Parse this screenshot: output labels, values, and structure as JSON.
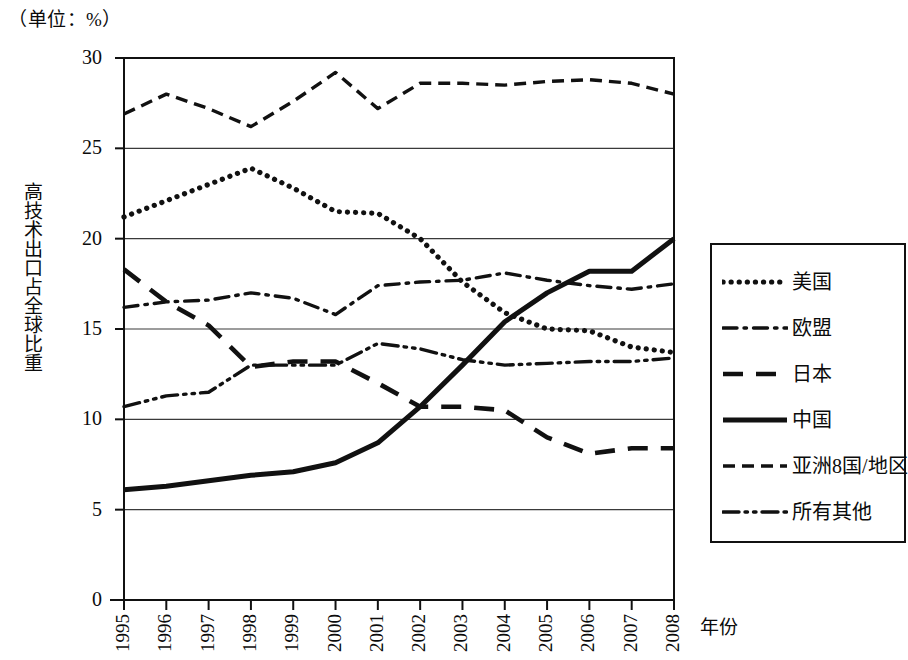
{
  "unit_note": "（单位：%）",
  "axis": {
    "y_title": "高技术出口占全球比重",
    "x_title": "年份",
    "y_ticks": [
      "0",
      "5",
      "10",
      "15",
      "20",
      "25",
      "30"
    ],
    "x_ticks": [
      "1995",
      "1996",
      "1997",
      "1998",
      "1999",
      "2000",
      "2001",
      "2002",
      "2003",
      "2004",
      "2005",
      "2006",
      "2007",
      "2008"
    ]
  },
  "legend": {
    "items": [
      {
        "label": "美国",
        "style": "dotted",
        "color": "#111111"
      },
      {
        "label": "欧盟",
        "style": "dash-dot",
        "color": "#111111"
      },
      {
        "label": "日本",
        "style": "dashed-long",
        "color": "#111111"
      },
      {
        "label": "中国",
        "style": "solid",
        "color": "#111111"
      },
      {
        "label": "亚洲8国/地区",
        "style": "dashed-short",
        "color": "#111111"
      },
      {
        "label": "所有其他",
        "style": "dash-dot-dot",
        "color": "#111111"
      }
    ]
  },
  "chart_data": {
    "type": "line",
    "title": "",
    "subtitle": "",
    "unit": "%",
    "xlabel": "年份",
    "ylabel": "高技术出口占全球比重",
    "xlim": [
      1995,
      2008
    ],
    "ylim": [
      0,
      30
    ],
    "ytick_step": 5,
    "grid": true,
    "grid_axis": "y",
    "legend_position": "right",
    "x": [
      1995,
      1996,
      1997,
      1998,
      1999,
      2000,
      2001,
      2002,
      2003,
      2004,
      2005,
      2006,
      2007,
      2008
    ],
    "series": [
      {
        "name": "美国",
        "style": "dotted",
        "values": [
          21.2,
          22.1,
          23.0,
          23.9,
          22.8,
          21.5,
          21.4,
          20.0,
          17.6,
          15.9,
          15.0,
          14.9,
          14.0,
          13.7
        ]
      },
      {
        "name": "欧盟",
        "style": "dash-dot",
        "values": [
          16.2,
          16.5,
          16.6,
          17.0,
          16.7,
          15.8,
          17.4,
          17.6,
          17.7,
          18.1,
          17.7,
          17.4,
          17.2,
          17.5
        ]
      },
      {
        "name": "日本",
        "style": "dashed-long",
        "values": [
          18.3,
          16.5,
          15.2,
          12.9,
          13.2,
          13.2,
          12.0,
          10.7,
          10.7,
          10.5,
          9.0,
          8.1,
          8.4,
          8.4
        ]
      },
      {
        "name": "中国",
        "style": "solid",
        "values": [
          6.1,
          6.3,
          6.6,
          6.9,
          7.1,
          7.6,
          8.7,
          10.7,
          13.0,
          15.4,
          17.0,
          18.2,
          18.2,
          20.0
        ]
      },
      {
        "name": "亚洲8国/地区",
        "style": "dashed-short",
        "values": [
          26.9,
          28.0,
          27.2,
          26.2,
          27.6,
          29.2,
          27.2,
          28.6,
          28.6,
          28.5,
          28.7,
          28.8,
          28.6,
          28.0
        ]
      },
      {
        "name": "所有其他",
        "style": "dash-dot-dot",
        "values": [
          10.7,
          11.3,
          11.5,
          13.0,
          13.0,
          13.0,
          14.2,
          13.9,
          13.3,
          13.0,
          13.1,
          13.2,
          13.2,
          13.4
        ]
      }
    ]
  }
}
